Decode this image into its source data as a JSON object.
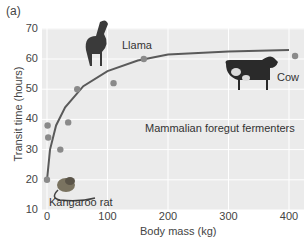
{
  "panel_label": "(a)",
  "chart_data": {
    "type": "scatter",
    "title": "",
    "annotation": "Mammalian foregut fermenters",
    "xlabel": "Body mass (kg)",
    "ylabel": "Transit time (hours)",
    "xlim": [
      0,
      420
    ],
    "ylim": [
      10,
      70
    ],
    "xticks": [
      0,
      100,
      200,
      300,
      400
    ],
    "yticks": [
      10,
      20,
      30,
      40,
      50,
      60,
      70
    ],
    "grid": true,
    "series": [
      {
        "name": "Mammalian foregut fermenters",
        "points": [
          {
            "x": 0,
            "y": 20
          },
          {
            "x": 1,
            "y": 38
          },
          {
            "x": 2,
            "y": 34
          },
          {
            "x": 22,
            "y": 30
          },
          {
            "x": 35,
            "y": 39
          },
          {
            "x": 50,
            "y": 50
          },
          {
            "x": 110,
            "y": 52
          },
          {
            "x": 160,
            "y": 60
          },
          {
            "x": 410,
            "y": 61
          }
        ]
      }
    ],
    "fit_curve": {
      "description": "saturating curve rising from ~20 h at 0 kg to ~63 h plateau near 400 kg",
      "points": [
        [
          0,
          20
        ],
        [
          5,
          30
        ],
        [
          15,
          38
        ],
        [
          30,
          44
        ],
        [
          60,
          51
        ],
        [
          100,
          56
        ],
        [
          150,
          59.5
        ],
        [
          200,
          61.5
        ],
        [
          300,
          62.5
        ],
        [
          400,
          63
        ]
      ]
    },
    "point_labels": [
      {
        "text": "Kangaroo rat",
        "x": 0,
        "y": 20
      },
      {
        "text": "Llama",
        "x": 160,
        "y": 60
      },
      {
        "text": "Cow",
        "x": 410,
        "y": 61
      }
    ],
    "colors": {
      "background": "#ebebeb",
      "grid": "#ffffff",
      "points": "#8a8a8a",
      "curve": "#5a5a5a"
    }
  },
  "labels": {
    "kangaroo_rat": "Kangaroo rat",
    "llama": "Llama",
    "cow": "Cow",
    "group": "Mammalian foregut fermenters"
  },
  "axis": {
    "x_label": "Body mass (kg)",
    "y_label": "Transit time (hours)",
    "x_ticks": [
      "0",
      "100",
      "200",
      "300",
      "400"
    ],
    "y_ticks": [
      "70",
      "60",
      "50",
      "40",
      "30",
      "20",
      "10"
    ]
  }
}
